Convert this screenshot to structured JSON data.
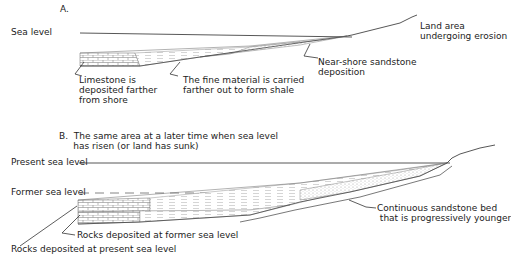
{
  "panel_a": {
    "title": "A.",
    "sea_level_label": "Sea level",
    "labels": {
      "land_area": "Land area\nundergoing erosion",
      "limestone": "Limestone is\ndeposited farther\nfrom shore",
      "fine_material": "The fine material is carried\nfarther out to form shale",
      "sandstone": "Near-shore sandstone\ndeposition"
    }
  },
  "panel_b": {
    "title": "B.  The same area at a later time when sea level\n     has risen (or land has sunk)",
    "present_sea_level_label": "Present sea level",
    "former_sea_level_label": "Former sea level",
    "labels": {
      "continuous_sandstone": "Continuous sandstone bed\n that is progressively younger",
      "rocks_former": "Rocks deposited at former sea level",
      "rocks_present": "Rocks deposited at present sea level"
    }
  },
  "colors": {
    "line": "#333333",
    "hatch": "#888888",
    "dashed": "#777777"
  }
}
